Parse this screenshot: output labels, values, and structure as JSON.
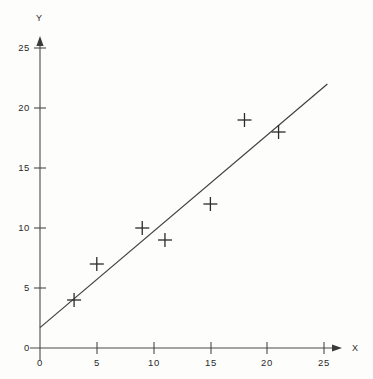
{
  "chart_data": {
    "type": "scatter",
    "title": "",
    "subtitle": "",
    "xlabel": "X",
    "ylabel": "Y",
    "xlim": [
      0,
      26
    ],
    "ylim": [
      0,
      26
    ],
    "xticks": [
      0,
      5,
      10,
      15,
      20,
      25
    ],
    "xtick_labels": [
      "0",
      "5",
      "10",
      "15",
      "20",
      "25"
    ],
    "yticks": [
      0,
      5,
      10,
      15,
      20,
      25
    ],
    "ytick_labels": [
      "0",
      "5",
      "10",
      "15",
      "20",
      "25"
    ],
    "grid": false,
    "legend": null,
    "marker": "plus",
    "points": [
      {
        "x": 3,
        "y": 4
      },
      {
        "x": 5,
        "y": 7
      },
      {
        "x": 9,
        "y": 10
      },
      {
        "x": 11,
        "y": 9
      },
      {
        "x": 15,
        "y": 12
      },
      {
        "x": 18,
        "y": 19
      },
      {
        "x": 21,
        "y": 18
      }
    ],
    "x": [
      3,
      5,
      9,
      11,
      15,
      18,
      21
    ],
    "y": [
      4,
      7,
      10,
      9,
      12,
      19,
      18
    ],
    "trend_line": {
      "type": "line",
      "label": "",
      "x_start": 0,
      "y_start": 1.7,
      "x_end": 25.3,
      "y_end": 22.0
    },
    "axis_arrows": {
      "x": true,
      "y": true
    },
    "colors": {
      "ink": "#3a3a3a",
      "marker": "#2b2b2b",
      "line": "#3f3f3f",
      "background": "#fdfdfc"
    }
  }
}
